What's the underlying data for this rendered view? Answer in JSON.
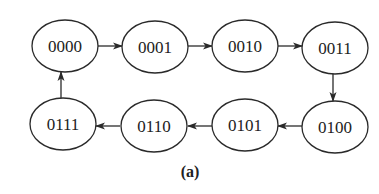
{
  "diagram": {
    "type": "state-transition-cycle",
    "caption": "(a)",
    "states": [
      {
        "id": "s0",
        "label": "0000",
        "cx": 65,
        "cy": 46
      },
      {
        "id": "s1",
        "label": "0001",
        "cx": 155,
        "cy": 47
      },
      {
        "id": "s2",
        "label": "0010",
        "cx": 245,
        "cy": 46
      },
      {
        "id": "s3",
        "label": "0011",
        "cx": 335,
        "cy": 48
      },
      {
        "id": "s4",
        "label": "0100",
        "cx": 335,
        "cy": 127
      },
      {
        "id": "s5",
        "label": "0101",
        "cx": 245,
        "cy": 125
      },
      {
        "id": "s6",
        "label": "0110",
        "cx": 154,
        "cy": 126
      },
      {
        "id": "s7",
        "label": "0111",
        "cx": 63,
        "cy": 124
      }
    ],
    "transitions": [
      {
        "from": "0000",
        "to": "0001"
      },
      {
        "from": "0001",
        "to": "0010"
      },
      {
        "from": "0010",
        "to": "0011"
      },
      {
        "from": "0011",
        "to": "0100"
      },
      {
        "from": "0100",
        "to": "0101"
      },
      {
        "from": "0101",
        "to": "0110"
      },
      {
        "from": "0110",
        "to": "0111"
      },
      {
        "from": "0111",
        "to": "0000"
      }
    ],
    "style": {
      "stroke_color": "#2a2a2a",
      "background": "#ffffff"
    }
  }
}
